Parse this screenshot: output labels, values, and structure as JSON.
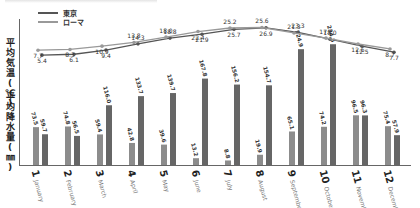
{
  "legend": {
    "items": [
      {
        "label": "東京",
        "color": "#555555"
      },
      {
        "label": "ローマ",
        "color": "#999999"
      }
    ]
  },
  "axes": {
    "temp_label": "平均気温(℃)",
    "rain_label": "平均降水量(㎜)"
  },
  "months": [
    {
      "num": "1",
      "name": "January"
    },
    {
      "num": "2",
      "name": "February"
    },
    {
      "num": "3",
      "name": "March"
    },
    {
      "num": "4",
      "name": "April"
    },
    {
      "num": "5",
      "name": "May"
    },
    {
      "num": "6",
      "name": "June"
    },
    {
      "num": "7",
      "name": "July"
    },
    {
      "num": "8",
      "name": "August"
    },
    {
      "num": "9",
      "name": "September"
    },
    {
      "num": "10",
      "name": "October"
    },
    {
      "num": "11",
      "name": "November"
    },
    {
      "num": "12",
      "name": "December"
    }
  ],
  "chart_data": {
    "type": "bar+line",
    "title": "",
    "categories": [
      "1 January",
      "2 February",
      "3 March",
      "4 April",
      "5 May",
      "6 June",
      "7 July",
      "8 August",
      "9 September",
      "10 October",
      "11 November",
      "12 December"
    ],
    "line_series": [
      {
        "name": "東京",
        "unit": "℃",
        "color": "#555555",
        "values": [
          5.4,
          6.1,
          9.4,
          14.3,
          18.8,
          21.9,
          25.7,
          26.9,
          23.3,
          18.0,
          12.5,
          7.7
        ]
      },
      {
        "name": "ローマ",
        "unit": "℃",
        "color": "#999999",
        "values": [
          7.7,
          8.3,
          10.9,
          13.8,
          18.0,
          22.4,
          25.2,
          25.6,
          21.3,
          17.2,
          12.6,
          8.7
        ]
      }
    ],
    "bar_series": [
      {
        "name": "ローマ",
        "unit": "mm",
        "color": "#8c8c8c",
        "values": [
          73.5,
          74.8,
          59.4,
          42.8,
          39.6,
          13.2,
          8.8,
          19.9,
          65.1,
          74.2,
          96.5,
          75.4
        ]
      },
      {
        "name": "東京",
        "unit": "mm",
        "color": "#666666",
        "values": [
          59.7,
          56.5,
          116.0,
          133.7,
          139.7,
          167.8,
          156.2,
          154.7,
          224.9,
          234.5,
          96.3,
          57.9
        ]
      }
    ],
    "ylabel_top": "平均気温(℃)",
    "ylabel_bottom": "平均降水量(㎜)",
    "legend_position": "top-left",
    "grid": false
  }
}
